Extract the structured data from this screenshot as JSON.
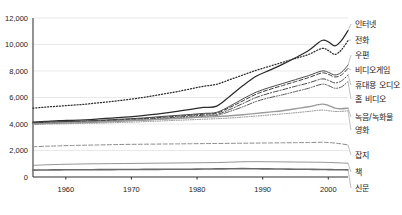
{
  "chart_data": {
    "type": "line",
    "title": "",
    "subtitle": "",
    "xlabel": "",
    "ylabel": "",
    "xlim": [
      1955,
      2003
    ],
    "ylim": [
      0,
      12000
    ],
    "grid": true,
    "legend_position": "right-inline-labels",
    "y_ticks": [
      "0",
      "2,000",
      "4,000",
      "6,000",
      "8,000",
      "10,000",
      "12,000"
    ],
    "y_tick_values": [
      0,
      2000,
      4000,
      6000,
      8000,
      10000,
      12000
    ],
    "x_ticks": [
      "1960",
      "1970",
      "1980",
      "1990",
      "2000"
    ],
    "x_tick_values": [
      1960,
      1970,
      1980,
      1990,
      2000
    ],
    "x": [
      1955,
      1957,
      1959,
      1961,
      1963,
      1965,
      1967,
      1969,
      1971,
      1973,
      1975,
      1977,
      1979,
      1981,
      1983,
      1985,
      1987,
      1989,
      1991,
      1993,
      1995,
      1997,
      1999,
      2000,
      2001,
      2002,
      2003
    ],
    "series": [
      {
        "name": "인터넷",
        "style": "solid",
        "width": 1.25,
        "color": "#2b2b2b",
        "values": [
          4150,
          4200,
          4250,
          4280,
          4320,
          4380,
          4450,
          4520,
          4600,
          4700,
          4820,
          4950,
          5100,
          5250,
          5350,
          6100,
          6900,
          7600,
          8050,
          8500,
          9000,
          9550,
          10300,
          10200,
          9900,
          10300,
          11050
        ]
      },
      {
        "name": "전화",
        "style": "dotted",
        "width": 1.25,
        "color": "#2b2b2b",
        "values": [
          5200,
          5280,
          5350,
          5420,
          5500,
          5600,
          5700,
          5820,
          5950,
          6100,
          6280,
          6450,
          6650,
          6850,
          7000,
          7350,
          7700,
          8050,
          8350,
          8650,
          8950,
          9250,
          9700,
          9550,
          9250,
          9600,
          10300
        ]
      },
      {
        "name": "우편",
        "style": "solid",
        "width": 1.0,
        "color": "#4a4a4a",
        "values": [
          4100,
          4150,
          4180,
          4200,
          4230,
          4280,
          4330,
          4380,
          4430,
          4500,
          4580,
          4650,
          4720,
          4800,
          4880,
          5350,
          5900,
          6400,
          6750,
          7050,
          7350,
          7650,
          8000,
          7900,
          7700,
          7900,
          8450
        ]
      },
      {
        "name": "비디오게임",
        "style": "dashed",
        "width": 1.0,
        "color": "#3a3a3a",
        "values": [
          4080,
          4120,
          4150,
          4170,
          4200,
          4240,
          4290,
          4340,
          4390,
          4450,
          4520,
          4590,
          4660,
          4740,
          4820,
          5250,
          5750,
          6250,
          6600,
          6900,
          7200,
          7500,
          7850,
          7750,
          7550,
          7700,
          8200
        ]
      },
      {
        "name": "휴대용 오디오",
        "style": "dashdot",
        "width": 1.0,
        "color": "#4a4a4a",
        "values": [
          4050,
          4090,
          4110,
          4130,
          4160,
          4200,
          4240,
          4290,
          4340,
          4400,
          4460,
          4520,
          4590,
          4660,
          4720,
          5100,
          5550,
          6000,
          6320,
          6580,
          6850,
          7100,
          7400,
          7300,
          7100,
          7250,
          7700
        ]
      },
      {
        "name": "홈 비디오",
        "style": "dashdotdot",
        "width": 1.0,
        "color": "#5a5a5a",
        "values": [
          4020,
          4050,
          4080,
          4100,
          4120,
          4150,
          4190,
          4230,
          4280,
          4330,
          4390,
          4450,
          4510,
          4580,
          4640,
          4950,
          5300,
          5700,
          5980,
          6200,
          6450,
          6700,
          7000,
          6900,
          6700,
          6800,
          7200
        ]
      },
      {
        "name": "녹음/녹화물",
        "style": "solid",
        "width": 1.4,
        "color": "#9a9a9a",
        "values": [
          4000,
          4050,
          4080,
          4100,
          4130,
          4160,
          4200,
          4240,
          4280,
          4320,
          4370,
          4420,
          4470,
          4520,
          4560,
          4620,
          4700,
          4800,
          4900,
          5000,
          5150,
          5300,
          5500,
          5400,
          5200,
          5150,
          5200
        ]
      },
      {
        "name": "영화",
        "style": "dotted",
        "width": 1.0,
        "color": "#8a8a8a",
        "values": [
          3950,
          3990,
          4010,
          4030,
          4050,
          4070,
          4100,
          4130,
          4160,
          4200,
          4240,
          4280,
          4320,
          4360,
          4400,
          4450,
          4520,
          4600,
          4680,
          4760,
          4850,
          4950,
          5050,
          5000,
          4950,
          4950,
          5000
        ]
      },
      {
        "name": "잡지",
        "style": "dashed",
        "width": 1.0,
        "color": "#8a8a8a",
        "values": [
          2280,
          2320,
          2350,
          2380,
          2400,
          2420,
          2440,
          2460,
          2470,
          2480,
          2490,
          2500,
          2510,
          2520,
          2530,
          2540,
          2550,
          2560,
          2570,
          2580,
          2590,
          2600,
          2620,
          2600,
          2560,
          2500,
          2420
        ]
      },
      {
        "name": "책",
        "style": "solid",
        "width": 0.8,
        "color": "#7a7a7a",
        "values": [
          880,
          920,
          950,
          970,
          990,
          1000,
          1010,
          1020,
          1030,
          1040,
          1050,
          1060,
          1070,
          1080,
          1090,
          1120,
          1150,
          1160,
          1150,
          1140,
          1130,
          1120,
          1110,
          1100,
          1080,
          1060,
          1040
        ]
      },
      {
        "name": "신문",
        "style": "solid",
        "width": 1.6,
        "color": "#6a6a6a",
        "values": [
          520,
          530,
          540,
          545,
          550,
          555,
          560,
          565,
          570,
          575,
          580,
          585,
          590,
          600,
          610,
          620,
          630,
          620,
          610,
          600,
          590,
          580,
          570,
          560,
          550,
          545,
          540
        ]
      }
    ]
  }
}
